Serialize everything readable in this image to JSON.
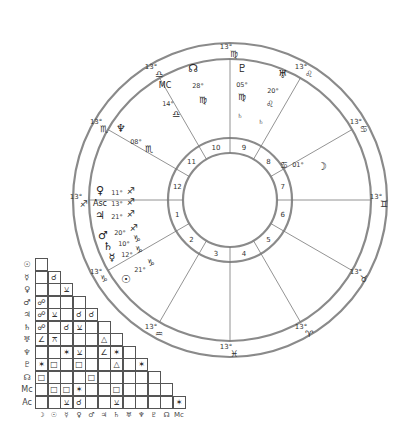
{
  "chart": {
    "center": [
      230,
      200
    ],
    "radii": {
      "outer": 157,
      "zodiac_inner": 141,
      "house_outer": 62,
      "inner": 47
    },
    "cusps": [
      {
        "house": 1,
        "angle": 180,
        "label": "13°",
        "sign": "♐"
      },
      {
        "house": 2,
        "angle": 210,
        "label": "13°",
        "sign": "♑"
      },
      {
        "house": 3,
        "angle": 240,
        "label": "13°",
        "sign": "♒"
      },
      {
        "house": 4,
        "angle": 270,
        "label": "13°",
        "sign": "♓"
      },
      {
        "house": 5,
        "angle": 300,
        "label": "13°",
        "sign": "♈"
      },
      {
        "house": 6,
        "angle": 330,
        "label": "13°",
        "sign": "♉"
      },
      {
        "house": 7,
        "angle": 0,
        "label": "13°",
        "sign": "♊"
      },
      {
        "house": 8,
        "angle": 30,
        "label": "13°",
        "sign": "♋"
      },
      {
        "house": 9,
        "angle": 60,
        "label": "13°",
        "sign": "♌"
      },
      {
        "house": 10,
        "angle": 90,
        "label": "13°",
        "sign": "♍"
      },
      {
        "house": 11,
        "angle": 120,
        "label": "13°",
        "sign": "♎"
      },
      {
        "house": 12,
        "angle": 150,
        "label": "13°",
        "sign": "♏"
      }
    ],
    "house_numbers": [
      "1",
      "2",
      "3",
      "4",
      "5",
      "6",
      "7",
      "8",
      "9",
      "10",
      "11",
      "12"
    ],
    "planets": [
      {
        "name": "pluto",
        "glyph": "♇",
        "x": 242,
        "y": 72,
        "deg": "05°",
        "dx": 242,
        "dy": 87,
        "sign": "♍",
        "sx": 242,
        "sy": 100
      },
      {
        "name": "uranus",
        "glyph": "♅",
        "x": 283,
        "y": 78,
        "deg": "20°",
        "dx": 273,
        "dy": 93,
        "sign": "♌",
        "sx": 270,
        "sy": 107
      },
      {
        "name": "north-node",
        "glyph": "☊",
        "x": 193,
        "y": 72,
        "deg": "28°",
        "dx": 198,
        "dy": 88,
        "sign": "♍",
        "sx": 203,
        "sy": 103
      },
      {
        "name": "midheaven",
        "glyph": "MC",
        "x": 165,
        "y": 88,
        "deg": "14°",
        "dx": 168,
        "dy": 106,
        "sign": "♎",
        "sx": 176,
        "sy": 117
      },
      {
        "name": "neptune",
        "glyph": "♆",
        "x": 121,
        "y": 132,
        "deg": "08°",
        "dx": 136,
        "dy": 144,
        "sign": "♏",
        "sx": 149,
        "sy": 152
      },
      {
        "name": "moon",
        "glyph": "☽",
        "x": 322,
        "y": 170,
        "deg": "01°",
        "dx": 298,
        "dy": 167,
        "sign": "♋",
        "sx": 284,
        "sy": 168
      },
      {
        "name": "venus",
        "glyph": "♀",
        "x": 100,
        "y": 194,
        "deg": "11°",
        "dx": 117,
        "dy": 195,
        "sign": "♐",
        "sx": 131,
        "sy": 194
      },
      {
        "name": "ascendant",
        "glyph": "Asc",
        "x": 100,
        "y": 206,
        "deg": "13°",
        "dx": 117,
        "dy": 206,
        "sign": "♐",
        "sx": 131,
        "sy": 205
      },
      {
        "name": "jupiter",
        "glyph": "♃",
        "x": 100,
        "y": 219,
        "deg": "21°",
        "dx": 117,
        "dy": 219,
        "sign": "♐",
        "sx": 131,
        "sy": 217
      },
      {
        "name": "mars",
        "glyph": "♂",
        "x": 103,
        "y": 239,
        "deg": "20°",
        "dx": 120,
        "dy": 235,
        "sign": "♐",
        "sx": 134,
        "sy": 231
      },
      {
        "name": "saturn",
        "glyph": "♄",
        "x": 108,
        "y": 250,
        "deg": "10°",
        "dx": 124,
        "dy": 246,
        "sign": "♑",
        "sx": 137,
        "sy": 242
      },
      {
        "name": "mercury",
        "glyph": "☿",
        "x": 112,
        "y": 261,
        "deg": "12°",
        "dx": 127,
        "dy": 257,
        "sign": "♑",
        "sx": 139,
        "sy": 253
      },
      {
        "name": "sun",
        "glyph": "☉",
        "x": 126,
        "y": 283,
        "deg": "21°",
        "dx": 140,
        "dy": 272,
        "sign": "♑",
        "sx": 151,
        "sy": 266
      }
    ],
    "small_marks": [
      {
        "text": "♄",
        "x": 240,
        "y": 118
      },
      {
        "text": "♄",
        "x": 261,
        "y": 124
      }
    ]
  },
  "aspect_grid": {
    "row_labels": [
      "☉",
      "☿",
      "♀",
      "♂",
      "♃",
      "♄",
      "♅",
      "♆",
      "♇",
      "☊",
      "Mc",
      "Ac"
    ],
    "col_labels": [
      "☽",
      "☉",
      "☿",
      "♀",
      "♂",
      "♃",
      "♄",
      "♅",
      "♆",
      "♇",
      "☊",
      "Mc"
    ],
    "rows": [
      [
        ""
      ],
      [
        "",
        "☌"
      ],
      [
        "",
        "",
        "⚺"
      ],
      [
        "☍",
        "",
        "",
        ""
      ],
      [
        "☍",
        "⚺",
        "",
        "☌",
        "☌"
      ],
      [
        "☍",
        "",
        "☌",
        "⚺",
        "",
        ""
      ],
      [
        "∠",
        "⚻",
        "",
        "",
        "",
        "△",
        ""
      ],
      [
        "",
        "",
        "✶",
        "⚺",
        "",
        "∠",
        "✶",
        ""
      ],
      [
        "✶",
        "□",
        "",
        "□",
        "",
        "",
        "△",
        "",
        "✶"
      ],
      [
        "□",
        "",
        "",
        "",
        "□",
        "",
        "",
        "",
        "",
        ""
      ],
      [
        "",
        "□",
        "□",
        "✶",
        "",
        "",
        "□",
        "",
        "",
        "",
        ""
      ],
      [
        "",
        "",
        "⚺",
        "☌",
        "",
        "",
        "⚺",
        "",
        "",
        "",
        "",
        "✶"
      ]
    ]
  }
}
